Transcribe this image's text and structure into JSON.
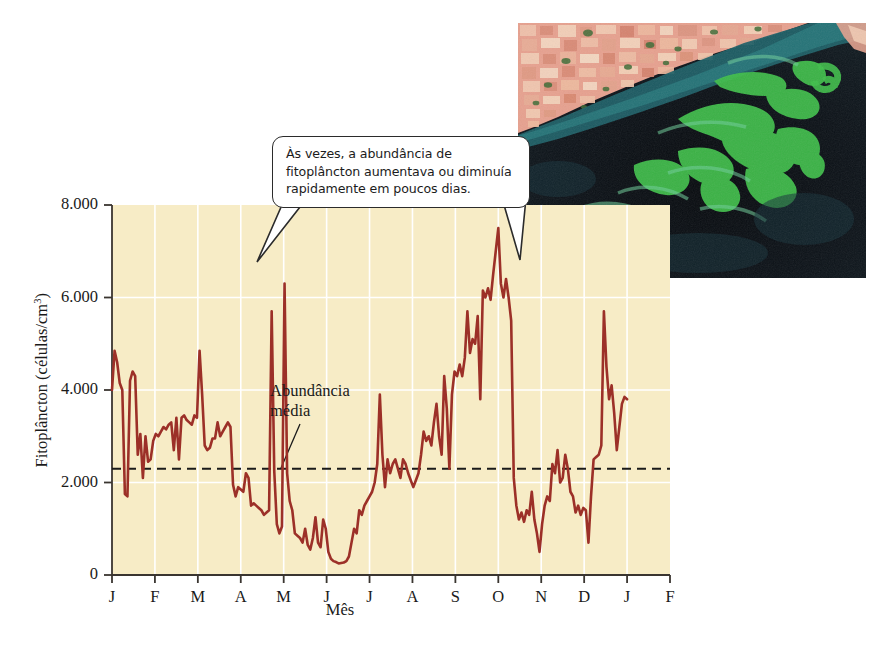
{
  "figure": {
    "name": "phytoplankton-abundance-figure",
    "background": "#ffffff"
  },
  "callout": {
    "text": "Às vezes, a abundância de fitoplâncton aumentava ou diminuía rapidamente em poucos dias.",
    "line1": "Às vezes, a abundância de",
    "line2": "fitoplâncton aumentava ou diminuía",
    "line3": "rapidamente em poucos dias."
  },
  "annotations": {
    "mean_label_line1": "Abundância",
    "mean_label_line2": "média"
  },
  "photo": {
    "alt": "satellite-image-algal-bloom",
    "land_color": "#e8a896",
    "water_color": "#0d1118",
    "bloom_color": "#3fbf4a"
  },
  "colors": {
    "plot_background": "#f7ecc6",
    "gridline": "#ffffff",
    "data_line": "#9c3028",
    "mean_line": "#1a1a1a",
    "axis": "#3a3530"
  },
  "chart_data": {
    "type": "line",
    "title": "",
    "xlabel": "Mês",
    "ylabel": "Fitoplâncton (células/cm3)",
    "ylabel_display": "Fitoplâncton (células/cm",
    "ylabel_exponent": "3",
    "ylabel_suffix": ")",
    "ylim": [
      0,
      8000
    ],
    "yticks": [
      0,
      2000,
      4000,
      6000,
      8000
    ],
    "ytick_labels": [
      "0",
      "2.000",
      "4.000",
      "6.000",
      "8.000"
    ],
    "xlim": [
      0,
      13
    ],
    "xticks": [
      0,
      1,
      2,
      3,
      4,
      5,
      6,
      7,
      8,
      9,
      10,
      11,
      12,
      13
    ],
    "categories": [
      "J",
      "F",
      "M",
      "A",
      "M",
      "J",
      "J",
      "A",
      "S",
      "O",
      "N",
      "D",
      "J",
      "F"
    ],
    "xtick_labels": [
      "J",
      "F",
      "M",
      "A",
      "M",
      "J",
      "J",
      "A",
      "S",
      "O",
      "N",
      "D",
      "J",
      "F"
    ],
    "grid": true,
    "grid_orientation": "both",
    "legend": false,
    "mean_line_value": 2300,
    "mean_line_style": "dashed",
    "series": [
      {
        "name": "Fitoplâncton",
        "color": "#9c3028",
        "x": [
          0.0,
          0.06,
          0.12,
          0.18,
          0.24,
          0.3,
          0.36,
          0.42,
          0.48,
          0.54,
          0.6,
          0.66,
          0.72,
          0.78,
          0.84,
          0.9,
          0.96,
          1.02,
          1.08,
          1.14,
          1.2,
          1.26,
          1.32,
          1.38,
          1.44,
          1.5,
          1.56,
          1.62,
          1.68,
          1.74,
          1.8,
          1.86,
          1.92,
          1.98,
          2.04,
          2.1,
          2.16,
          2.22,
          2.28,
          2.34,
          2.4,
          2.46,
          2.52,
          2.58,
          2.64,
          2.7,
          2.76,
          2.82,
          2.88,
          2.94,
          3.0,
          3.06,
          3.12,
          3.18,
          3.24,
          3.3,
          3.36,
          3.42,
          3.48,
          3.54,
          3.6,
          3.66,
          3.72,
          3.78,
          3.84,
          3.9,
          3.96,
          4.02,
          4.08,
          4.14,
          4.2,
          4.26,
          4.32,
          4.38,
          4.44,
          4.5,
          4.56,
          4.62,
          4.68,
          4.74,
          4.8,
          4.86,
          4.92,
          4.98,
          5.04,
          5.1,
          5.16,
          5.22,
          5.28,
          5.34,
          5.4,
          5.46,
          5.52,
          5.58,
          5.64,
          5.7,
          5.76,
          5.82,
          5.88,
          5.94,
          6.0,
          6.06,
          6.12,
          6.18,
          6.24,
          6.3,
          6.36,
          6.42,
          6.48,
          6.54,
          6.6,
          6.66,
          6.72,
          6.78,
          6.84,
          6.9,
          6.96,
          7.02,
          7.08,
          7.14,
          7.2,
          7.26,
          7.32,
          7.38,
          7.44,
          7.5,
          7.56,
          7.62,
          7.68,
          7.74,
          7.8,
          7.86,
          7.92,
          7.98,
          8.04,
          8.1,
          8.16,
          8.22,
          8.28,
          8.34,
          8.4,
          8.46,
          8.52,
          8.58,
          8.64,
          8.7,
          8.76,
          8.82,
          8.88,
          8.94,
          9.0,
          9.06,
          9.12,
          9.18,
          9.24,
          9.3,
          9.36,
          9.42,
          9.48,
          9.54,
          9.6,
          9.66,
          9.72,
          9.78,
          9.84,
          9.9,
          9.96,
          10.02,
          10.08,
          10.14,
          10.2,
          10.26,
          10.32,
          10.38,
          10.44,
          10.5,
          10.56,
          10.62,
          10.68,
          10.74,
          10.8,
          10.86,
          10.92,
          10.98,
          11.04,
          11.1,
          11.16,
          11.22,
          11.28,
          11.34,
          11.4,
          11.46,
          11.52,
          11.58,
          11.64,
          11.7,
          11.76,
          11.82,
          11.88,
          11.94,
          12.0
        ],
        "values": [
          4000,
          4850,
          4600,
          4150,
          4000,
          1750,
          1700,
          4200,
          4400,
          4300,
          2600,
          3050,
          2100,
          3000,
          2450,
          2500,
          2900,
          3050,
          3000,
          3100,
          3200,
          3150,
          3250,
          3300,
          2700,
          3400,
          2500,
          3400,
          3450,
          3350,
          3300,
          3250,
          3450,
          3400,
          4850,
          3900,
          2800,
          2700,
          2750,
          2950,
          2950,
          3300,
          3000,
          3100,
          3200,
          3300,
          3200,
          1950,
          1700,
          1900,
          1850,
          1800,
          2200,
          2100,
          1500,
          1550,
          1500,
          1450,
          1400,
          1300,
          1350,
          1400,
          5700,
          2250,
          1100,
          900,
          1050,
          6300,
          2200,
          1600,
          1400,
          900,
          850,
          800,
          700,
          1000,
          650,
          550,
          800,
          1250,
          700,
          600,
          1200,
          1000,
          500,
          350,
          300,
          280,
          250,
          260,
          270,
          300,
          400,
          700,
          1000,
          900,
          1400,
          1300,
          1500,
          1600,
          1700,
          1800,
          2000,
          2400,
          3900,
          2600,
          1900,
          2500,
          2200,
          2400,
          2500,
          2300,
          2100,
          2500,
          2400,
          2200,
          2050,
          1900,
          2050,
          2200,
          2600,
          3100,
          2900,
          3000,
          2800,
          3300,
          3700,
          3000,
          2600,
          4300,
          3600,
          2300,
          3900,
          4400,
          4300,
          4550,
          4300,
          4700,
          5700,
          4800,
          5100,
          5000,
          5600,
          3800,
          6150,
          6000,
          6200,
          5950,
          6500,
          7000,
          7500,
          6300,
          6000,
          6400,
          6000,
          5500,
          2100,
          1500,
          1200,
          1350,
          1150,
          1400,
          1300,
          1800,
          1200,
          900,
          500,
          1100,
          1500,
          1700,
          1600,
          2400,
          2200,
          2700,
          2000,
          2100,
          2600,
          2300,
          1800,
          1700,
          1350,
          1500,
          1300,
          1450,
          1400,
          700,
          1700,
          2500,
          2550,
          2600,
          2800,
          5700,
          4500,
          3800,
          4100,
          3500,
          2700,
          3200,
          3700,
          3850,
          3800
        ]
      }
    ]
  }
}
